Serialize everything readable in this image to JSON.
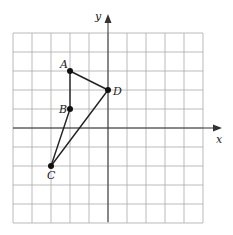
{
  "diagram": {
    "type": "coordinate-grid",
    "axes": {
      "x_label": "x",
      "y_label": "y"
    },
    "grid": {
      "x_min": -5,
      "x_max": 5,
      "y_min": -5,
      "y_max": 5,
      "step": 1
    },
    "points": [
      {
        "name": "A",
        "x": -2,
        "y": 3
      },
      {
        "name": "B",
        "x": -2,
        "y": 1
      },
      {
        "name": "C",
        "x": -3,
        "y": -2
      },
      {
        "name": "D",
        "x": 0,
        "y": 2
      }
    ],
    "segments": [
      [
        "A",
        "B"
      ],
      [
        "B",
        "C"
      ],
      [
        "C",
        "D"
      ],
      [
        "D",
        "A"
      ]
    ],
    "colors": {
      "grid": "#aaaaaa",
      "line": "#222222"
    }
  }
}
